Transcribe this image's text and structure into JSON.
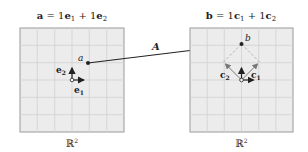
{
  "left_panel": {
    "title_lhs": "a",
    "title_rest": " = 1",
    "title_e1": "e",
    "title_e1_sub": "1",
    "title_plus": " + 1",
    "title_e2": "e",
    "title_e2_sub": "2",
    "point_label": "a",
    "basis1_label": "e",
    "basis1_sub": "1",
    "basis2_label": "e",
    "basis2_sub": "2",
    "space_label": "ℝ",
    "space_sup": "2"
  },
  "right_panel": {
    "title_lhs": "b",
    "title_rest": " = 1",
    "title_c1": "c",
    "title_c1_sub": "1",
    "title_plus": " + 1",
    "title_c2": "c",
    "title_c2_sub": "2",
    "point_label": "b",
    "basis1_label": "c",
    "basis1_sub": "1",
    "basis2_label": "c",
    "basis2_sub": "2",
    "space_label": "ℝ",
    "space_sup": "2"
  },
  "mapping": {
    "label": "A"
  },
  "colors": {
    "grid_fill": "#ececec",
    "grid_line": "#cfcfcf",
    "border": "#9a9a9a",
    "ink": "#222222",
    "dashed": "#a8a8a8"
  }
}
